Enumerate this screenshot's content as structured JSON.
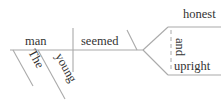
{
  "diagram": {
    "type": "sentence-diagram",
    "sentence": "The young man seemed honest and upright",
    "subject": "man",
    "subject_modifiers": [
      "The",
      "young"
    ],
    "verb": "seemed",
    "predicate_adjectives": [
      "honest",
      "upright"
    ],
    "conjunction": "and",
    "line_color": "#aaaaaa",
    "text_color": "#333333"
  }
}
